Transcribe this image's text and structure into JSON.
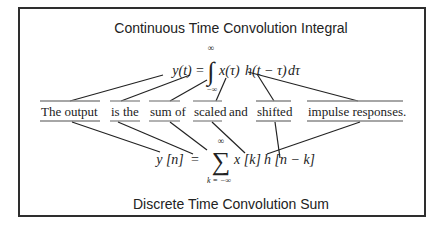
{
  "diagram": {
    "top_title": "Continuous Time Convolution Integral",
    "bottom_title": "Discrete Time Convolution Sum",
    "continuous": {
      "lhs": "y(t)",
      "equals": "=",
      "integral_symbol": "∫",
      "upper_limit": "∞",
      "lower_limit": "−∞",
      "x_term": "x(τ)",
      "h_term": "h(t − τ)",
      "d_term": "dτ"
    },
    "discrete": {
      "lhs": "y [n]",
      "equals": "=",
      "sum_symbol": "∑",
      "upper_limit": "∞",
      "lower_limit": "k = −∞",
      "x_term": "x [k]",
      "h_term": "h [n − k]"
    },
    "sentence": {
      "words": [
        {
          "text": "The output",
          "underlined": true
        },
        {
          "text": "is the",
          "underlined": true
        },
        {
          "text": "sum of",
          "underlined": true
        },
        {
          "text": "scaled",
          "underlined": true
        },
        {
          "text": "and",
          "underlined": false
        },
        {
          "text": "shifted",
          "underlined": true
        },
        {
          "text": "impulse responses.",
          "underlined": true
        }
      ]
    }
  }
}
